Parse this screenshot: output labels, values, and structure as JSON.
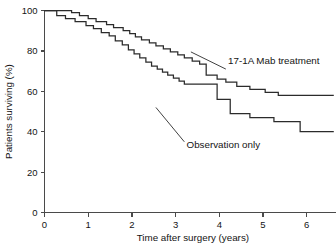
{
  "chart_data": {
    "type": "line",
    "subtype": "kaplan-meier-step",
    "title": "",
    "xlabel": "Time after surgery (years)",
    "ylabel": "Patients surviving (%)",
    "xlim": [
      0,
      6.7
    ],
    "ylim": [
      0,
      100
    ],
    "xticks": [
      0,
      1,
      2,
      3,
      4,
      5,
      6
    ],
    "xtick_labels": [
      "0",
      "1",
      "2",
      "3",
      "4",
      "5",
      "6"
    ],
    "yticks": [
      0,
      20,
      40,
      60,
      80,
      100
    ],
    "ytick_labels": [
      "0",
      "20",
      "40",
      "60",
      "80",
      "100"
    ],
    "grid": false,
    "legend_position": "inline-annotations",
    "series": [
      {
        "name": "17-1A Mab treatment",
        "label_x": 4.2,
        "label_y": 73.5,
        "leader_from_x": 4.15,
        "leader_from_y": 71.0,
        "leader_to_x": 3.35,
        "leader_to_y": 79.5,
        "final_value": 58,
        "points": [
          [
            0.0,
            100
          ],
          [
            0.62,
            100
          ],
          [
            0.62,
            99
          ],
          [
            0.8,
            99
          ],
          [
            0.8,
            97.5
          ],
          [
            1.0,
            97.5
          ],
          [
            1.0,
            96
          ],
          [
            1.18,
            96
          ],
          [
            1.18,
            94.5
          ],
          [
            1.42,
            94.5
          ],
          [
            1.42,
            93
          ],
          [
            1.58,
            93
          ],
          [
            1.58,
            91.5
          ],
          [
            1.8,
            91.5
          ],
          [
            1.8,
            90
          ],
          [
            1.95,
            90
          ],
          [
            1.95,
            88.5
          ],
          [
            2.08,
            88.5
          ],
          [
            2.08,
            87
          ],
          [
            2.22,
            87
          ],
          [
            2.22,
            85.5
          ],
          [
            2.4,
            85.5
          ],
          [
            2.4,
            84
          ],
          [
            2.55,
            84
          ],
          [
            2.55,
            82.5
          ],
          [
            2.72,
            82.5
          ],
          [
            2.72,
            81
          ],
          [
            2.88,
            81
          ],
          [
            2.88,
            79.5
          ],
          [
            3.05,
            79.5
          ],
          [
            3.05,
            78
          ],
          [
            3.2,
            78
          ],
          [
            3.2,
            76.5
          ],
          [
            3.38,
            76.5
          ],
          [
            3.38,
            75
          ],
          [
            3.55,
            75
          ],
          [
            3.55,
            73.5
          ],
          [
            3.7,
            73.5
          ],
          [
            3.7,
            68
          ],
          [
            3.95,
            68
          ],
          [
            3.95,
            66
          ],
          [
            4.15,
            66
          ],
          [
            4.15,
            64.5
          ],
          [
            4.4,
            64.5
          ],
          [
            4.4,
            62.5
          ],
          [
            4.7,
            62.5
          ],
          [
            4.7,
            61
          ],
          [
            5.05,
            61
          ],
          [
            5.05,
            59.5
          ],
          [
            5.35,
            59.5
          ],
          [
            5.35,
            58
          ],
          [
            6.62,
            58
          ]
        ]
      },
      {
        "name": "Observation only",
        "label_x": 3.25,
        "label_y": 32.0,
        "leader_from_x": 3.2,
        "leader_from_y": 35.0,
        "leader_to_x": 2.55,
        "leader_to_y": 52.0,
        "final_value": 40,
        "points": [
          [
            0.0,
            100
          ],
          [
            0.28,
            100
          ],
          [
            0.28,
            97.5
          ],
          [
            0.48,
            97.5
          ],
          [
            0.48,
            96
          ],
          [
            0.7,
            96
          ],
          [
            0.7,
            94.5
          ],
          [
            0.95,
            94.5
          ],
          [
            0.95,
            92.5
          ],
          [
            1.12,
            92.5
          ],
          [
            1.12,
            91
          ],
          [
            1.3,
            91
          ],
          [
            1.3,
            89
          ],
          [
            1.48,
            89
          ],
          [
            1.48,
            87.5
          ],
          [
            1.62,
            87.5
          ],
          [
            1.62,
            85
          ],
          [
            1.78,
            85
          ],
          [
            1.78,
            83
          ],
          [
            1.92,
            83
          ],
          [
            1.92,
            80.5
          ],
          [
            2.05,
            80.5
          ],
          [
            2.05,
            78.5
          ],
          [
            2.18,
            78.5
          ],
          [
            2.18,
            76.5
          ],
          [
            2.32,
            76.5
          ],
          [
            2.32,
            74.5
          ],
          [
            2.45,
            74.5
          ],
          [
            2.45,
            72.5
          ],
          [
            2.58,
            72.5
          ],
          [
            2.58,
            71
          ],
          [
            2.7,
            71
          ],
          [
            2.7,
            69.5
          ],
          [
            2.82,
            69.5
          ],
          [
            2.82,
            68
          ],
          [
            2.95,
            68
          ],
          [
            2.95,
            66.5
          ],
          [
            3.08,
            66.5
          ],
          [
            3.08,
            65
          ],
          [
            3.2,
            65
          ],
          [
            3.2,
            63.5
          ],
          [
            3.95,
            63.5
          ],
          [
            3.95,
            56
          ],
          [
            4.25,
            56
          ],
          [
            4.25,
            49
          ],
          [
            4.7,
            49
          ],
          [
            4.7,
            47
          ],
          [
            5.25,
            47
          ],
          [
            5.25,
            45
          ],
          [
            5.85,
            45
          ],
          [
            5.85,
            40
          ],
          [
            6.62,
            40
          ]
        ]
      }
    ]
  },
  "figure": {
    "background_color": "#ffffff",
    "axis_color": "#4a4a4a",
    "curve_color": "#2b2b2b",
    "text_color": "#141414"
  }
}
